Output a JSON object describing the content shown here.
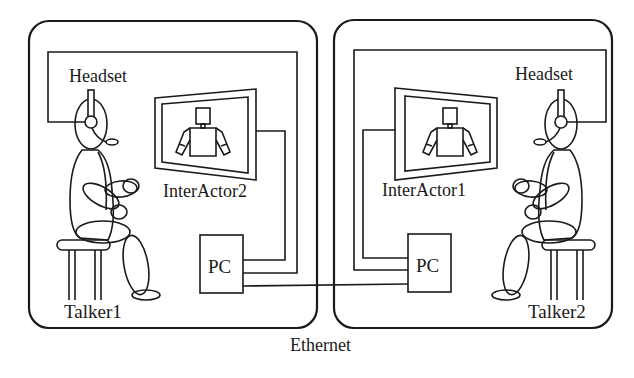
{
  "diagram": {
    "type": "system-setup",
    "rooms": [
      {
        "id": "room-1",
        "headset_label": "Headset",
        "display_label": "InterActor2",
        "pc_label": "PC",
        "talker_label": "Talker1"
      },
      {
        "id": "room-2",
        "headset_label": "Headset",
        "display_label": "InterActor1",
        "pc_label": "PC",
        "talker_label": "Talker2"
      }
    ],
    "network_label": "Ethernet",
    "colors": {
      "stroke": "#1a1a1a",
      "background": "#ffffff"
    }
  }
}
